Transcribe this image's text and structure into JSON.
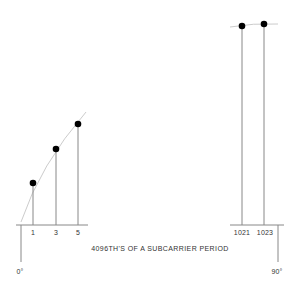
{
  "diagram": {
    "axis_title": "4096TH'S OF A SUBCARRIER PERIOD",
    "start_label": "0°",
    "end_label": "90°",
    "colors": {
      "line": "#888888",
      "dot": "#000000",
      "curve": "#cccccc",
      "text": "#333333"
    },
    "samples": [
      {
        "label": "1",
        "x": 33,
        "y": 183
      },
      {
        "label": "3",
        "x": 56,
        "y": 149
      },
      {
        "label": "5",
        "x": 78,
        "y": 124
      },
      {
        "label": "1021",
        "x": 242,
        "y": 26
      },
      {
        "label": "1023",
        "x": 264,
        "y": 24
      }
    ]
  }
}
